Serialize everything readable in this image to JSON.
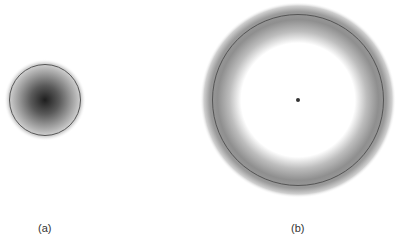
{
  "figure": {
    "panels": [
      {
        "label": "(a)",
        "description": "filled disk with dark center fading outward, outlined circle"
      },
      {
        "label": "(b)",
        "description": "ring-shaped gray annulus with outlined circle and center dot"
      }
    ],
    "colors": {
      "outline": "#555555",
      "fill_dark": "#222222",
      "fill_gray": "#8a8a8a",
      "background": "#ffffff"
    }
  }
}
